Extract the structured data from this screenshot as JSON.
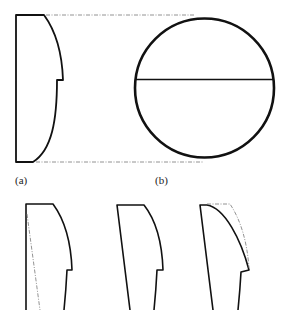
{
  "figure": {
    "type": "technical-diagram",
    "colors": {
      "stroke": "#111111",
      "dashed": "#777777",
      "background": "#ffffff"
    }
  },
  "panels": [
    {
      "id": "a",
      "label": "(a)",
      "content": "side profile with curved top-right edge and step notch; dashed projection lines to circle"
    },
    {
      "id": "b",
      "label": "(b)",
      "content": "circle with horizontal diameter line"
    },
    {
      "id": "c1",
      "label": "",
      "content": "side profile variant with dashed inclined reference line"
    },
    {
      "id": "c2",
      "label": "",
      "content": "tapered profile variant"
    },
    {
      "id": "c3",
      "label": "",
      "content": "tapered profile variant with dashed original contour overlay"
    }
  ]
}
